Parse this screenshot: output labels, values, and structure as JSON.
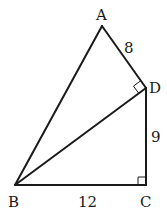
{
  "diagram": {
    "points": {
      "A": {
        "label": "A",
        "x": 102,
        "y": 26
      },
      "B": {
        "label": "B",
        "x": 15,
        "y": 185
      },
      "C": {
        "label": "C",
        "x": 146,
        "y": 185
      },
      "D": {
        "label": "D",
        "x": 146,
        "y": 88
      }
    },
    "segments": [
      {
        "from": "A",
        "to": "B"
      },
      {
        "from": "A",
        "to": "D"
      },
      {
        "from": "B",
        "to": "D"
      },
      {
        "from": "D",
        "to": "C"
      },
      {
        "from": "B",
        "to": "C"
      }
    ],
    "lengths": {
      "AD": "8",
      "DC": "9",
      "BC": "12"
    },
    "right_angles": [
      "ADB",
      "BCD"
    ],
    "colors": {
      "line": "#1a1a1a",
      "background": "#ffffff"
    }
  }
}
